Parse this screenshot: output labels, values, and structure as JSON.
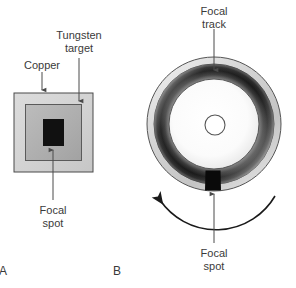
{
  "figure": {
    "background_color": "#ffffff",
    "width": 296,
    "height": 288
  },
  "panels": [
    {
      "letter": "A",
      "name": "stationary-anode",
      "labels": [
        {
          "id": "copper",
          "text": "Copper",
          "lines": [
            "Copper"
          ]
        },
        {
          "id": "tungsten-target",
          "text": "Tungsten target",
          "lines": [
            "Tungsten",
            "target"
          ]
        },
        {
          "id": "focal-spot",
          "text": "Focal spot",
          "lines": [
            "Focal",
            "spot"
          ]
        }
      ],
      "parts": {
        "copper_block_color": "#d4d4d4",
        "tungsten_target_color": "#b0b0b0",
        "focal_spot_color": "#111111",
        "outline_color": "#4a4a4a"
      }
    },
    {
      "letter": "B",
      "name": "rotating-anode",
      "labels": [
        {
          "id": "focal-track",
          "text": "Focal track",
          "lines": [
            "Focal",
            "track"
          ]
        },
        {
          "id": "focal-spot",
          "text": "Focal spot",
          "lines": [
            "Focal",
            "spot"
          ]
        }
      ],
      "parts": {
        "disc_rim_color": "#cfcfcf",
        "focal_track_dark": "#1d1d1d",
        "disc_center_color": "#ffffff",
        "focal_spot_color": "#0a0a0a",
        "outline_color": "#4a4a4a",
        "rotation_direction": "counterclockwise"
      }
    }
  ],
  "text": {
    "focal": "Focal",
    "track": "track",
    "spot": "spot",
    "copper": "Copper",
    "tungsten": "Tungsten",
    "target": "target",
    "panel_a": "A",
    "panel_b": "B"
  }
}
